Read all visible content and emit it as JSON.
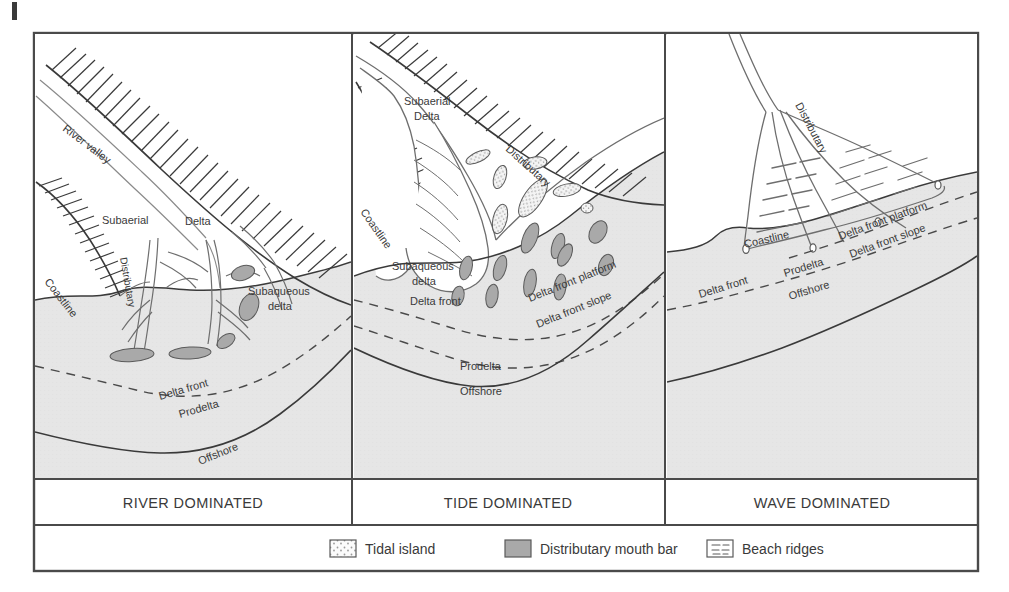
{
  "figure": {
    "frame_color": "#4a4a4a",
    "sea_fill": "#e4e4e4",
    "land_fill": "#ffffff",
    "bar_fill": "#a9a9a9",
    "island_fill": "#f2f2f2",
    "line_color": "#3a3a3a"
  },
  "panels": [
    {
      "id": "river",
      "title": "RIVER DOMINATED",
      "labels": [
        {
          "key": "river_valley",
          "text": "River valley"
        },
        {
          "key": "subaerial",
          "text": "Subaerial"
        },
        {
          "key": "delta",
          "text": "Delta"
        },
        {
          "key": "distributary",
          "text": "Distributary"
        },
        {
          "key": "coastline",
          "text": "Coastline"
        },
        {
          "key": "subaqueous_1",
          "text": "Subaqueous"
        },
        {
          "key": "subaqueous_2",
          "text": "delta"
        },
        {
          "key": "delta_front",
          "text": "Delta front"
        },
        {
          "key": "prodelta",
          "text": "Prodelta"
        },
        {
          "key": "offshore",
          "text": "Offshore"
        }
      ]
    },
    {
      "id": "tide",
      "title": "TIDE DOMINATED",
      "labels": [
        {
          "key": "subaerial_1",
          "text": "Subaerial"
        },
        {
          "key": "subaerial_2",
          "text": "Delta"
        },
        {
          "key": "distributary",
          "text": "Distributary"
        },
        {
          "key": "coastline",
          "text": "Coastline"
        },
        {
          "key": "subaqueous_1",
          "text": "Subaqueous"
        },
        {
          "key": "subaqueous_2",
          "text": "delta"
        },
        {
          "key": "delta_front",
          "text": "Delta front"
        },
        {
          "key": "df_platform",
          "text": "Delta  front platform"
        },
        {
          "key": "df_slope",
          "text": "Delta front slope"
        },
        {
          "key": "prodelta",
          "text": "Prodelta"
        },
        {
          "key": "offshore",
          "text": "Offshore"
        }
      ]
    },
    {
      "id": "wave",
      "title": "WAVE DOMINATED",
      "labels": [
        {
          "key": "distributary",
          "text": "Distributary"
        },
        {
          "key": "coastline",
          "text": "Coastline"
        },
        {
          "key": "df_platform",
          "text": "Delta front platform"
        },
        {
          "key": "df_slope",
          "text": "Delta front slope"
        },
        {
          "key": "delta_front",
          "text": "Delta front"
        },
        {
          "key": "prodelta",
          "text": "Prodelta"
        },
        {
          "key": "offshore",
          "text": "Offshore"
        }
      ]
    }
  ],
  "legend": {
    "items": [
      {
        "key": "tidal_island",
        "label": "Tidal island",
        "swatch": "stipple"
      },
      {
        "key": "distributary_mouth_bar",
        "label": "Distributary mouth bar",
        "swatch": "solid-gray"
      },
      {
        "key": "beach_ridges",
        "label": "Beach ridges",
        "swatch": "dashes"
      }
    ]
  }
}
